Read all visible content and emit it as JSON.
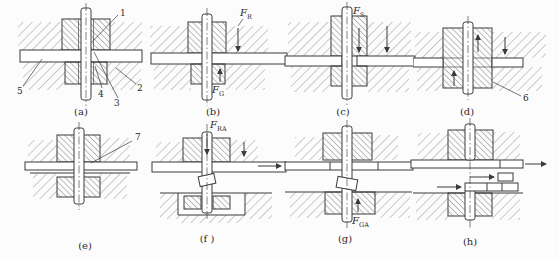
{
  "figure": {
    "colors": {
      "line": "#3a3a3a",
      "background": "#fcfcfc"
    },
    "panels": {
      "a": {
        "caption": "(a)",
        "parts": {
          "p1": "1",
          "p2": "2",
          "p3": "3",
          "p4": "4",
          "p5": "5"
        }
      },
      "b": {
        "caption": "(b)",
        "forces": {
          "FR": {
            "sym": "F",
            "sub": "R"
          },
          "FG": {
            "sym": "F",
            "sub": "G"
          }
        }
      },
      "c": {
        "caption": "(c)",
        "forces": {
          "FS": {
            "sym": "F",
            "sub": "S"
          }
        }
      },
      "d": {
        "caption": "(d)",
        "parts": {
          "p6": "6"
        }
      },
      "e": {
        "caption": "(e)",
        "parts": {
          "p7": "7"
        }
      },
      "f": {
        "caption": "(f )",
        "forces": {
          "FRA": {
            "sym": "F",
            "sub": "RA"
          }
        }
      },
      "g": {
        "caption": "(g)",
        "forces": {
          "FGA": {
            "sym": "F",
            "sub": "GA"
          }
        }
      },
      "h": {
        "caption": "(h)"
      }
    }
  }
}
